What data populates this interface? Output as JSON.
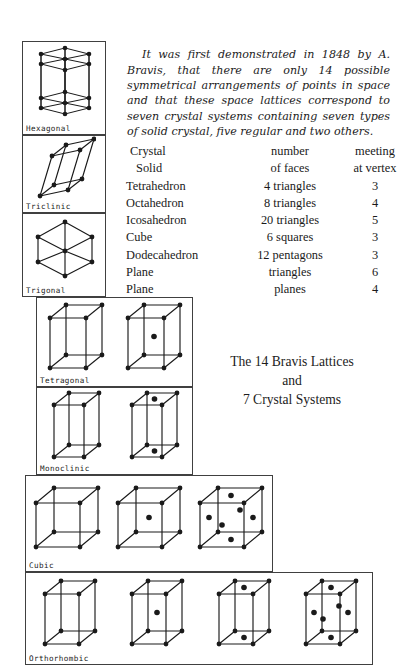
{
  "document": {
    "title": "The 14 Bravis Lattices and 7 Crystal Systems"
  },
  "prose": {
    "paragraph": "It was first demonstrated in 1848 by A. Bravis, that there are only 14 possible symmetrical arrangements of points in space and that these space lattices correspond to seven crystal systems containing seven types of solid crystal, five regular and two others."
  },
  "table": {
    "header": {
      "solid": "Crystal",
      "faces": "number",
      "vertex": "meeting"
    },
    "header2": {
      "solid": "Solid",
      "faces": "of faces",
      "vertex": "at vertex"
    },
    "rows": [
      {
        "solid": "Tetrahedron",
        "faces": "4 triangles",
        "vertex": "3"
      },
      {
        "solid": "Octahedron",
        "faces": "8 triangles",
        "vertex": "4"
      },
      {
        "solid": "Icosahedron",
        "faces": "20 triangles",
        "vertex": "5"
      },
      {
        "solid": "Cube",
        "faces": "6 squares",
        "vertex": "3"
      },
      {
        "solid": "Dodecahedron",
        "faces": "12 pentagons",
        "vertex": "3"
      },
      {
        "solid": "Plane",
        "faces": "triangles",
        "vertex": "6"
      },
      {
        "solid": "Plane",
        "faces": "planes",
        "vertex": "4"
      }
    ]
  },
  "title_block": {
    "line1": "The 14 Bravis Lattices",
    "line2": "and",
    "line3": "7 Crystal Systems"
  },
  "lattice_panels": [
    {
      "label": "Hexagonal",
      "cell_count": 1,
      "lattice_types": [
        "hexagonal-prism"
      ]
    },
    {
      "label": "Triclinic",
      "cell_count": 1,
      "lattice_types": [
        "simple"
      ]
    },
    {
      "label": "Trigonal",
      "cell_count": 1,
      "lattice_types": [
        "rhombohedral"
      ]
    },
    {
      "label": "Tetragonal",
      "cell_count": 2,
      "lattice_types": [
        "simple",
        "body-centered"
      ]
    },
    {
      "label": "Monoclinic",
      "cell_count": 2,
      "lattice_types": [
        "simple",
        "base-centered"
      ]
    },
    {
      "label": "Cubic",
      "cell_count": 3,
      "lattice_types": [
        "simple",
        "body-centered",
        "face-centered"
      ]
    },
    {
      "label": "Orthorhombic",
      "cell_count": 4,
      "lattice_types": [
        "simple",
        "body-centered",
        "base-centered",
        "face-centered"
      ]
    }
  ],
  "colors": {
    "background": "#ffffff",
    "ink": "#1a1a1a",
    "frame": "#404040"
  }
}
